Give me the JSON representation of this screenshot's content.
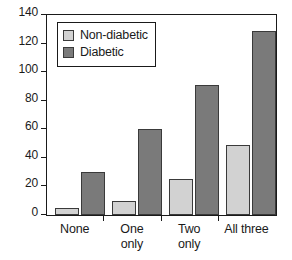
{
  "chart_data": {
    "type": "bar",
    "title": "",
    "subtitle": "",
    "xlabel": "",
    "ylabel": "",
    "categories": [
      "None",
      "One\nonly",
      "Two\nonly",
      "All three"
    ],
    "series": [
      {
        "name": "Non-diabetic",
        "color": "#d2d2d2",
        "values": [
          5,
          10,
          25,
          49
        ]
      },
      {
        "name": "Diabetic",
        "color": "#7a7a7a",
        "values": [
          30,
          60,
          91,
          129
        ]
      }
    ],
    "ylim": [
      0,
      140
    ],
    "ytick_values": [
      0,
      20,
      40,
      60,
      80,
      100,
      120,
      140
    ],
    "ytick_labels": [
      "0",
      "20",
      "40",
      "60",
      "80",
      "100",
      "120",
      "140"
    ],
    "grid": false,
    "legend_position": "upper left",
    "legend_entries": [
      "Non-diabetic",
      "Diabetic"
    ],
    "annotations": []
  },
  "legend": {
    "items": [
      {
        "label": "Non-diabetic",
        "swatch": "light"
      },
      {
        "label": "Diabetic",
        "swatch": "dark"
      }
    ]
  },
  "axes": {
    "frame_color": "#1a1a1a",
    "bar_edge_color": "#3a3a3a",
    "background": "#ffffff"
  }
}
